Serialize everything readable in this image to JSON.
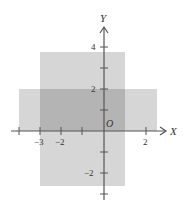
{
  "diagram": {
    "axes": {
      "x_label": "X",
      "y_label": "Y",
      "origin_label": "O",
      "x_tick_labels": [
        {
          "value": -3,
          "text": "−3"
        },
        {
          "value": -2,
          "text": "−2"
        },
        {
          "value": 2,
          "text": "2"
        }
      ],
      "y_tick_labels": [
        {
          "value": 4,
          "text": "4"
        },
        {
          "value": 2,
          "text": "2"
        },
        {
          "value": -2,
          "text": "−2"
        }
      ],
      "x_ticks": [
        -4,
        -3,
        -2,
        -1,
        2
      ],
      "y_ticks": [
        4,
        3,
        2,
        1,
        -1,
        -2,
        -3
      ]
    },
    "regions": [
      {
        "name": "vertical-strip",
        "x_range": [
          -3,
          1
        ],
        "y_range": [
          -2.6,
          3.75
        ],
        "color": "#d6d6d6"
      },
      {
        "name": "horizontal-strip",
        "x_range": [
          -4,
          2.5
        ],
        "y_range": [
          0,
          2
        ],
        "color": "#d6d6d6"
      },
      {
        "name": "overlap",
        "x_range": [
          -3,
          1
        ],
        "y_range": [
          0,
          2
        ],
        "color": "#b4b4b4"
      }
    ],
    "colors": {
      "axis": "#555555",
      "text": "#333333"
    }
  }
}
